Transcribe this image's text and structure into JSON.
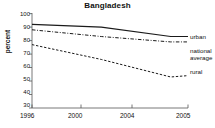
{
  "chart_data": {
    "type": "line",
    "title": "Bangladesh",
    "xlabel": "",
    "ylabel": "percent",
    "x": [
      1996,
      2000,
      2004,
      2005
    ],
    "xtick_labels": [
      "1996",
      "2000",
      "2004",
      "2005"
    ],
    "ytick_labels": [
      "100",
      "90",
      "80",
      "70",
      "60",
      "50",
      "40",
      "30"
    ],
    "yticks": [
      100,
      90,
      80,
      70,
      60,
      50,
      40,
      30
    ],
    "ylim": [
      30,
      100
    ],
    "xlim": [
      1996,
      2005
    ],
    "grid": false,
    "legend_position": "right-inline",
    "series": [
      {
        "name": "urban",
        "values": [
          92,
          90,
          83,
          83
        ],
        "style": "solid"
      },
      {
        "name": "national average",
        "values": [
          88,
          83,
          79,
          79
        ],
        "style": "dash-dot"
      },
      {
        "name": "rural",
        "values": [
          77,
          66,
          53,
          54
        ],
        "style": "dashed"
      }
    ]
  },
  "labels": {
    "urban": "urban",
    "national_average_line1": "national",
    "national_average_line2": "average",
    "rural": "rural"
  },
  "colors": {
    "line": "#1a1a1a",
    "axis": "#555555",
    "background": "#ffffff"
  }
}
